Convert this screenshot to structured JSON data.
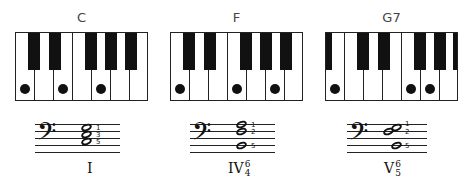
{
  "chords": [
    {
      "name": "C",
      "roman": "I",
      "figure_top": "",
      "figure_bottom": "",
      "white_keys": [
        "C",
        "D",
        "E",
        "F",
        "G",
        "A",
        "B"
      ],
      "dotted_white_keys": [
        0,
        2,
        4
      ],
      "fingering": [
        "1",
        "3",
        "5"
      ]
    },
    {
      "name": "F",
      "roman": "IV",
      "figure_top": "6",
      "figure_bottom": "4",
      "white_keys": [
        "C",
        "D",
        "E",
        "F",
        "G",
        "A",
        "B"
      ],
      "dotted_white_keys": [
        0,
        3,
        5
      ],
      "fingering": [
        "1",
        "2",
        "5"
      ]
    },
    {
      "name": "G7",
      "roman": "V",
      "figure_top": "6",
      "figure_bottom": "5",
      "white_keys": [
        "B",
        "C",
        "D",
        "E",
        "F",
        "G",
        "A"
      ],
      "dotted_white_keys": [
        0,
        4,
        5
      ],
      "fingering": [
        "1",
        "2",
        "5"
      ]
    }
  ],
  "clef": "bass-clef",
  "clef_glyph": "𝄢"
}
